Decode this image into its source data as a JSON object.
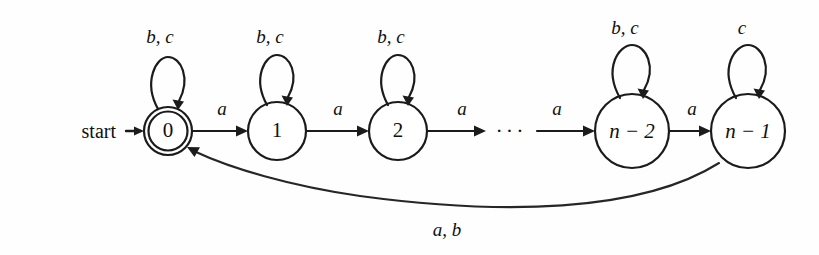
{
  "figure": {
    "kind": "finite-automaton-state-diagram",
    "background_color": "#fefefe",
    "ink_color": "#1b1b1b"
  },
  "start": {
    "label": "start",
    "arrow_target_state": "0"
  },
  "states": [
    {
      "id": "s0",
      "label": "0",
      "label_style": "upright",
      "accepting": true,
      "cx": 168,
      "cy": 131,
      "r": 24,
      "inner_r": 20
    },
    {
      "id": "s1",
      "label": "1",
      "label_style": "upright",
      "accepting": false,
      "cx": 277,
      "cy": 131,
      "r": 29,
      "inner_r": 0
    },
    {
      "id": "s2",
      "label": "2",
      "label_style": "upright",
      "accepting": false,
      "cx": 398,
      "cy": 131,
      "r": 29,
      "inner_r": 0
    },
    {
      "id": "sn2",
      "label": "n − 2",
      "label_style": "italic",
      "accepting": false,
      "cx": 632,
      "cy": 131,
      "r": 37,
      "inner_r": 0
    },
    {
      "id": "sn1",
      "label": "n − 1",
      "label_style": "italic",
      "accepting": false,
      "cx": 748,
      "cy": 131,
      "r": 37,
      "inner_r": 0
    }
  ],
  "self_loops": [
    {
      "state": "s0",
      "label": "b, c",
      "label_x": 160,
      "label_y": 39
    },
    {
      "state": "s1",
      "label": "b, c",
      "label_x": 270,
      "label_y": 39
    },
    {
      "state": "s2",
      "label": "b, c",
      "label_x": 391,
      "label_y": 39
    },
    {
      "state": "sn2",
      "label": "b, c",
      "label_x": 625,
      "label_y": 30
    },
    {
      "state": "sn1",
      "label": "c",
      "label_x": 742,
      "label_y": 30
    }
  ],
  "transitions": [
    {
      "from": "s0",
      "to": "s1",
      "label": "a",
      "label_x": 222,
      "label_y": 111
    },
    {
      "from": "s1",
      "to": "s2",
      "label": "a",
      "label_x": 338,
      "label_y": 111
    },
    {
      "from": "s2",
      "to": "ellipsis",
      "label": "a",
      "label_x": 462,
      "label_y": 111
    },
    {
      "from": "ellipsis",
      "to": "sn2",
      "label": "a",
      "label_x": 557,
      "label_y": 111
    },
    {
      "from": "sn2",
      "to": "sn1",
      "label": "a",
      "label_x": 692,
      "label_y": 111
    }
  ],
  "ellipsis": {
    "glyph": "···",
    "x": 511,
    "y": 131
  },
  "return_edge": {
    "from": "sn1",
    "to": "s0",
    "label": "a, b",
    "label_x": 447,
    "label_y": 232
  }
}
